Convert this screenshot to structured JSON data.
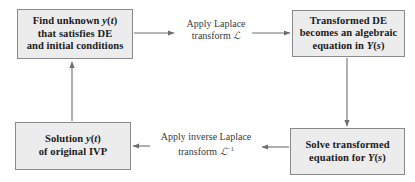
{
  "diagram": {
    "box_fill": "#ececec",
    "box_border": "#8a8a8a",
    "arrow_color": "#6e6e6e",
    "text_color": "#1a1a1a"
  },
  "nodes": {
    "find": {
      "line1": "Find unknown ",
      "math1": "y",
      "paren1": "(",
      "math2": "t",
      "paren2": ")",
      "line2": "that satisfies DE",
      "line3": "and initial conditions"
    },
    "transformed": {
      "line1": "Transformed DE",
      "line2": "becomes an algebraic",
      "line3_pre": "equation in ",
      "line3_math": "Y",
      "line3_paren1": "(",
      "line3_mathvar": "s",
      "line3_paren2": ")"
    },
    "solution": {
      "line1_pre": "Solution ",
      "line1_math": "y",
      "line1_paren1": "(",
      "line1_mathvar": "t",
      "line1_paren2": ")",
      "line2": "of original IVP"
    },
    "solve": {
      "line1": "Solve transformed",
      "line2_pre": "equation for ",
      "line2_math": "Y",
      "line2_paren1": "(",
      "line2_mathvar": "s",
      "line2_paren2": ")"
    }
  },
  "edges": {
    "forward": {
      "line1": "Apply Laplace",
      "line2_pre": "transform ",
      "line2_symbol": "ℒ"
    },
    "inverse": {
      "line1": "Apply inverse Laplace",
      "line2_pre": "transform ",
      "line2_symbol": "ℒ",
      "line2_exponent": "−1"
    }
  }
}
